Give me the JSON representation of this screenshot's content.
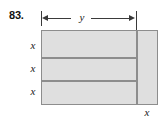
{
  "figure": {
    "problem_number": "83.",
    "labels": {
      "width_label": "y",
      "height_label_1": "x",
      "height_label_2": "x",
      "height_label_3": "x",
      "side_label": "x"
    },
    "colors": {
      "fill": "#dfdfdf",
      "stroke": "#8d8d8d",
      "dimension_line": "#3a3a3a",
      "text": "#1a1a1a",
      "background": "#ffffff"
    }
  }
}
